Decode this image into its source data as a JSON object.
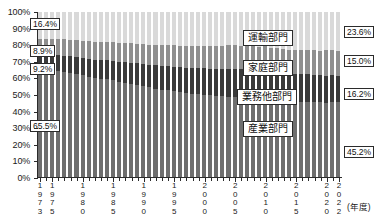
{
  "chart_data": {
    "type": "bar",
    "subtype": "100% stacked bar",
    "title": "",
    "xlabel": "(年度)",
    "ylabel": "",
    "ylim": [
      0,
      100
    ],
    "grid": false,
    "legend_position": "inside-plot",
    "y_ticks": [
      "0%",
      "10%",
      "20%",
      "30%",
      "40%",
      "50%",
      "60%",
      "70%",
      "80%",
      "90%",
      "100%"
    ],
    "y_tick_values": [
      0,
      10,
      20,
      30,
      40,
      50,
      60,
      70,
      80,
      90,
      100
    ],
    "x_tick_labels": [
      "1973",
      "1975",
      "1980",
      "1985",
      "1990",
      "1995",
      "2000",
      "2005",
      "2010",
      "2015",
      "2020",
      "2022"
    ],
    "categories": [
      "1973",
      "1974",
      "1975",
      "1976",
      "1977",
      "1978",
      "1979",
      "1980",
      "1981",
      "1982",
      "1983",
      "1984",
      "1985",
      "1986",
      "1987",
      "1988",
      "1989",
      "1990",
      "1991",
      "1992",
      "1993",
      "1994",
      "1995",
      "1996",
      "1997",
      "1998",
      "1999",
      "2000",
      "2001",
      "2002",
      "2003",
      "2004",
      "2005",
      "2006",
      "2007",
      "2008",
      "2009",
      "2010",
      "2011",
      "2012",
      "2013",
      "2014",
      "2015",
      "2016",
      "2017",
      "2018",
      "2019",
      "2020",
      "2021",
      "2022"
    ],
    "series": [
      {
        "name": "産業部門",
        "name_en": "Industrial sector",
        "color": "#6e6e6e",
        "stack_order": 3,
        "first_value": 65.5,
        "last_value": 45.2,
        "values": [
          65.5,
          65.0,
          64.2,
          64.0,
          63.5,
          62.8,
          62.5,
          61.6,
          60.8,
          60.0,
          59.6,
          59.4,
          58.6,
          57.6,
          57.0,
          56.6,
          56.0,
          55.2,
          54.5,
          53.6,
          53.0,
          52.6,
          52.0,
          51.4,
          51.0,
          50.4,
          50.2,
          49.8,
          49.4,
          49.0,
          48.8,
          48.6,
          48.2,
          48.0,
          47.8,
          47.2,
          46.6,
          46.8,
          46.4,
          46.2,
          46.0,
          45.8,
          45.6,
          45.6,
          45.5,
          45.4,
          45.2,
          44.8,
          45.4,
          45.2
        ]
      },
      {
        "name": "業務他部門",
        "name_en": "Business and other sector",
        "color": "#3a3a3a",
        "stack_order": 2,
        "first_value": 9.2,
        "last_value": 16.2,
        "values": [
          9.2,
          9.4,
          9.8,
          9.9,
          10.1,
          10.4,
          10.5,
          10.8,
          11.0,
          11.2,
          11.4,
          11.6,
          11.9,
          12.2,
          12.5,
          12.7,
          13.0,
          13.3,
          13.6,
          14.0,
          14.3,
          14.6,
          14.9,
          15.1,
          15.3,
          15.5,
          15.7,
          16.0,
          16.3,
          16.5,
          16.7,
          16.9,
          17.2,
          17.3,
          17.5,
          17.6,
          17.7,
          17.8,
          17.4,
          17.2,
          17.0,
          16.9,
          16.8,
          16.8,
          16.7,
          16.6,
          16.6,
          16.5,
          16.3,
          16.2
        ]
      },
      {
        "name": "家庭部門",
        "name_en": "Household sector",
        "color": "#8f8f8f",
        "stack_order": 1,
        "first_value": 8.9,
        "last_value": 15.0,
        "values": [
          8.9,
          9.1,
          9.4,
          9.6,
          9.8,
          10.0,
          10.1,
          10.3,
          10.5,
          10.7,
          10.9,
          11.0,
          11.2,
          11.4,
          11.6,
          11.7,
          11.9,
          12.0,
          12.2,
          12.4,
          12.6,
          12.8,
          13.0,
          13.1,
          13.3,
          13.4,
          13.6,
          13.7,
          13.9,
          14.0,
          14.1,
          14.2,
          14.3,
          14.4,
          14.5,
          14.6,
          14.7,
          14.8,
          14.6,
          14.5,
          14.4,
          14.4,
          14.4,
          14.5,
          14.6,
          14.7,
          14.8,
          15.6,
          15.1,
          15.0
        ]
      },
      {
        "name": "運輸部門",
        "name_en": "Transport sector",
        "color": "#d9d9d9",
        "stack_order": 0,
        "first_value": 16.4,
        "last_value": 23.6,
        "values": [
          16.4,
          16.5,
          16.6,
          16.5,
          16.6,
          16.8,
          16.9,
          17.3,
          17.7,
          18.1,
          18.1,
          18.0,
          18.3,
          18.8,
          18.9,
          19.0,
          19.1,
          19.5,
          19.7,
          20.0,
          20.1,
          20.0,
          20.1,
          20.4,
          20.4,
          20.7,
          20.5,
          20.5,
          20.4,
          20.5,
          20.4,
          20.3,
          20.3,
          20.3,
          20.2,
          20.6,
          21.0,
          20.6,
          21.6,
          22.1,
          22.6,
          22.9,
          23.2,
          23.1,
          23.2,
          23.3,
          23.4,
          23.1,
          23.2,
          23.6
        ]
      }
    ],
    "annotations": {
      "left_labels": [
        {
          "series": "運輸部門",
          "text": "16.4%"
        },
        {
          "series": "家庭部門",
          "text": "8.9%"
        },
        {
          "series": "業務他部門",
          "text": "9.2%"
        },
        {
          "series": "産業部門",
          "text": "65.5%"
        }
      ],
      "right_labels": [
        {
          "series": "運輸部門",
          "text": "23.6%"
        },
        {
          "series": "家庭部門",
          "text": "15.0%"
        },
        {
          "series": "業務他部門",
          "text": "16.2%"
        },
        {
          "series": "産業部門",
          "text": "45.2%"
        }
      ],
      "legend_chips": [
        {
          "text": "運輸部門"
        },
        {
          "text": "家庭部門"
        },
        {
          "text": "業務他部門"
        },
        {
          "text": "産業部門"
        }
      ]
    }
  }
}
